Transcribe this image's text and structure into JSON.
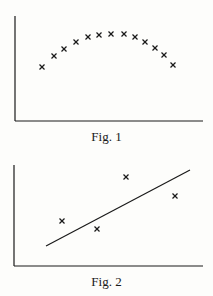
{
  "chart_data": [
    {
      "type": "scatter",
      "title": "Fig. 1",
      "xlabel": "",
      "ylabel": "",
      "grid": false,
      "marker": "x",
      "points_px": [
        [
          42,
          67
        ],
        [
          54,
          56
        ],
        [
          64,
          49
        ],
        [
          76,
          42
        ],
        [
          88,
          37
        ],
        [
          99,
          35
        ],
        [
          111,
          34
        ],
        [
          124,
          34
        ],
        [
          135,
          37
        ],
        [
          145,
          42
        ],
        [
          155,
          48
        ],
        [
          164,
          55
        ],
        [
          173,
          65
        ]
      ],
      "description": "13 points forming an inverted-U (parabolic) arc, no tick labels"
    },
    {
      "type": "scatter",
      "title": "Fig. 2",
      "xlabel": "",
      "ylabel": "",
      "grid": false,
      "marker": "x",
      "points_px": [
        [
          62,
          221
        ],
        [
          97,
          229
        ],
        [
          126,
          177
        ],
        [
          175,
          196
        ]
      ],
      "fit_line_px": [
        [
          46,
          246
        ],
        [
          190,
          170
        ]
      ],
      "description": "4 scattered points with a straight best-fit line, no tick labels"
    }
  ],
  "captions": {
    "fig1": "Fig. 1",
    "fig2": "Fig. 2"
  },
  "colors": {
    "ink": "#1a1a1a",
    "paper": "#fdfdfb"
  }
}
